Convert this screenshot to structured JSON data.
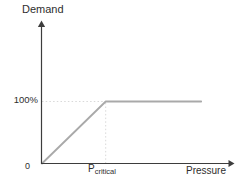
{
  "chart_data": {
    "type": "line",
    "title": "",
    "xlabel": "Pressure",
    "ylabel": "Demand",
    "x_range": [
      0,
      3
    ],
    "y_range": [
      0,
      2.3
    ],
    "x_ticks": [
      {
        "value": 0,
        "label": "0"
      },
      {
        "value": 1,
        "label": "P",
        "sub": "critical"
      }
    ],
    "y_ticks": [
      {
        "value": 1,
        "label": "100%"
      }
    ],
    "series": [
      {
        "name": "demand-vs-pressure-curve",
        "color": "#a9a9a9",
        "points": [
          [
            0,
            0
          ],
          [
            1,
            1
          ],
          [
            2.5,
            1
          ]
        ]
      }
    ],
    "guides": [
      {
        "name": "guide-100pct-horizontal",
        "from": [
          0,
          1
        ],
        "to": [
          1,
          1
        ],
        "style": "dotted"
      },
      {
        "name": "guide-pcritical-vertical",
        "from": [
          1,
          0
        ],
        "to": [
          1,
          1
        ],
        "style": "dotted"
      }
    ],
    "legend": "none",
    "grid": "off",
    "colors": {
      "axis": "#3d3d3d",
      "line": "#a9a9a9",
      "guide": "#d9d9d9",
      "text": "#2e2e2e",
      "background": "#ffffff"
    }
  }
}
